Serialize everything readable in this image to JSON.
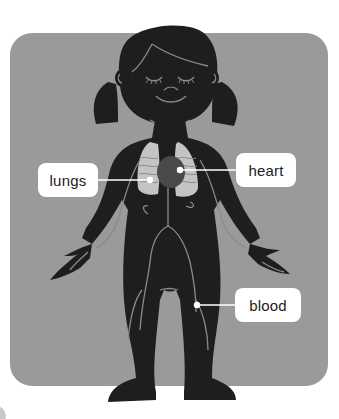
{
  "illustration": {
    "subject": "girl body silhouette showing circulatory and respiratory organs",
    "colors": {
      "panel": "#9a9a9a",
      "silhouette": "#1e1e1e",
      "veins": "#8a8a8a",
      "lungs": "#c4c4c4",
      "heart": "#4a4a4a",
      "label_bg": "#ffffff",
      "leader_line": "#ffffff"
    }
  },
  "labels": [
    {
      "id": "lungs",
      "text": "lungs"
    },
    {
      "id": "heart",
      "text": "heart"
    },
    {
      "id": "blood",
      "text": "blood"
    }
  ]
}
